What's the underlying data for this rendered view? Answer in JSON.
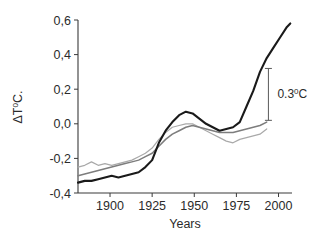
{
  "chart_data": {
    "type": "line",
    "title": "",
    "subtitle": "",
    "xlabel": "Years",
    "ylabel": "ΔT⁰C.",
    "xlim": [
      1881,
      2008
    ],
    "ylim": [
      -0.4,
      0.6
    ],
    "xticks": [
      1900,
      1925,
      1950,
      1975,
      2000
    ],
    "xticklabels": [
      "1900",
      "1925",
      "1950",
      "1975",
      "2000"
    ],
    "yticks": [
      -0.4,
      -0.2,
      0.0,
      0.2,
      0.4,
      0.6
    ],
    "yticklabels": [
      "-0,4",
      "-0,2",
      "0,0",
      "0,2",
      "0,4",
      "0,6"
    ],
    "grid": false,
    "legend": "none",
    "decimal_separator": "comma",
    "annotations": [
      {
        "text": "0.3⁰0C",
        "label": "0.3",
        "unit": "⁰C",
        "kind": "vertical-span-arrow",
        "x": 1994,
        "y_top": 0.32,
        "y_bottom": 0.02,
        "value": 0.3
      }
    ],
    "series": [
      {
        "name": "black-thick-curve",
        "color": "#1a1a1a",
        "width": 2.1,
        "x": [
          1881,
          1885,
          1889,
          1893,
          1897,
          1901,
          1905,
          1909,
          1913,
          1917,
          1921,
          1925,
          1929,
          1933,
          1937,
          1941,
          1945,
          1949,
          1953,
          1957,
          1961,
          1965,
          1969,
          1973,
          1977,
          1981,
          1985,
          1989,
          1993,
          1997,
          2001,
          2005,
          2007
        ],
        "y": [
          -0.34,
          -0.33,
          -0.33,
          -0.32,
          -0.31,
          -0.3,
          -0.31,
          -0.3,
          -0.29,
          -0.28,
          -0.25,
          -0.21,
          -0.11,
          -0.04,
          0.01,
          0.05,
          0.07,
          0.06,
          0.03,
          0.0,
          -0.02,
          -0.04,
          -0.03,
          -0.02,
          0.01,
          0.1,
          0.19,
          0.3,
          0.38,
          0.44,
          0.5,
          0.56,
          0.58
        ]
      },
      {
        "name": "medium-gray-curve",
        "color": "#7d7d7d",
        "width": 1.5,
        "x": [
          1881,
          1885,
          1889,
          1893,
          1897,
          1901,
          1905,
          1909,
          1913,
          1917,
          1921,
          1925,
          1929,
          1933,
          1937,
          1941,
          1945,
          1949,
          1953,
          1957,
          1961,
          1965,
          1969,
          1973,
          1977,
          1981,
          1985,
          1989,
          1993
        ],
        "y": [
          -0.3,
          -0.29,
          -0.28,
          -0.27,
          -0.26,
          -0.25,
          -0.24,
          -0.23,
          -0.22,
          -0.21,
          -0.19,
          -0.17,
          -0.13,
          -0.09,
          -0.06,
          -0.04,
          -0.02,
          -0.01,
          -0.02,
          -0.03,
          -0.04,
          -0.05,
          -0.05,
          -0.05,
          -0.04,
          -0.03,
          -0.02,
          -0.01,
          0.01
        ]
      },
      {
        "name": "light-gray-curve",
        "color": "#a9a9a9",
        "width": 1.2,
        "x": [
          1881,
          1885,
          1889,
          1893,
          1897,
          1901,
          1905,
          1909,
          1913,
          1917,
          1921,
          1925,
          1929,
          1933,
          1937,
          1941,
          1945,
          1949,
          1953,
          1957,
          1961,
          1965,
          1969,
          1973,
          1977,
          1981,
          1985,
          1989,
          1993
        ],
        "y": [
          -0.25,
          -0.24,
          -0.22,
          -0.24,
          -0.23,
          -0.24,
          -0.23,
          -0.22,
          -0.21,
          -0.19,
          -0.17,
          -0.14,
          -0.09,
          -0.05,
          -0.02,
          -0.01,
          0.0,
          0.0,
          -0.02,
          -0.04,
          -0.06,
          -0.08,
          -0.1,
          -0.11,
          -0.09,
          -0.08,
          -0.07,
          -0.06,
          -0.03
        ]
      }
    ]
  },
  "axes": {
    "y_axis_name": "temperature-anomaly-axis",
    "x_axis_name": "year-axis"
  }
}
